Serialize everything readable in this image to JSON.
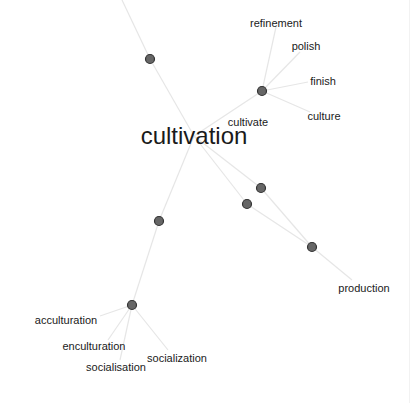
{
  "graph": {
    "type": "word-association-network",
    "center_word": "cultivation",
    "colors": {
      "background": "#ffffff",
      "node_fill": "#666666",
      "node_stroke": "#333333",
      "edge": "#e6e6e6",
      "label": "#1a1a1a"
    },
    "nodes": [
      {
        "id": "n_top",
        "x": 150,
        "y": 59
      },
      {
        "id": "n_cultivate",
        "x": 262,
        "y": 91
      },
      {
        "id": "n_mid1",
        "x": 261,
        "y": 188
      },
      {
        "id": "n_mid2",
        "x": 247,
        "y": 204
      },
      {
        "id": "n_left",
        "x": 159,
        "y": 221
      },
      {
        "id": "n_production",
        "x": 312,
        "y": 247
      },
      {
        "id": "n_social",
        "x": 132,
        "y": 305
      }
    ],
    "labels": [
      {
        "text": "cultivation",
        "x": 194,
        "y": 144,
        "size": "main"
      },
      {
        "text": "cultivate",
        "x": 248,
        "y": 126,
        "size": "small"
      },
      {
        "text": "refinement",
        "x": 276,
        "y": 27,
        "size": "small"
      },
      {
        "text": "polish",
        "x": 306,
        "y": 50,
        "size": "small"
      },
      {
        "text": "finish",
        "x": 323,
        "y": 85,
        "size": "small"
      },
      {
        "text": "culture",
        "x": 324,
        "y": 120,
        "size": "small"
      },
      {
        "text": "production",
        "x": 364,
        "y": 292,
        "size": "small"
      },
      {
        "text": "acculturation",
        "x": 66,
        "y": 324,
        "size": "small"
      },
      {
        "text": "enculturation",
        "x": 94,
        "y": 350,
        "size": "small"
      },
      {
        "text": "socialisation",
        "x": 116,
        "y": 371,
        "size": "small"
      },
      {
        "text": "socialization",
        "x": 177,
        "y": 362,
        "size": "small"
      }
    ],
    "edges": [
      {
        "from": [
          122,
          0
        ],
        "to": [
          150,
          59
        ]
      },
      {
        "from": [
          150,
          59
        ],
        "to": [
          194,
          136
        ]
      },
      {
        "from": [
          194,
          136
        ],
        "to": [
          262,
          91
        ]
      },
      {
        "from": [
          262,
          91
        ],
        "to": [
          276,
          27
        ]
      },
      {
        "from": [
          262,
          91
        ],
        "to": [
          300,
          52
        ]
      },
      {
        "from": [
          262,
          91
        ],
        "to": [
          308,
          82
        ]
      },
      {
        "from": [
          262,
          91
        ],
        "to": [
          310,
          112
        ]
      },
      {
        "from": [
          194,
          136
        ],
        "to": [
          261,
          188
        ]
      },
      {
        "from": [
          194,
          136
        ],
        "to": [
          247,
          204
        ]
      },
      {
        "from": [
          247,
          204
        ],
        "to": [
          312,
          247
        ]
      },
      {
        "from": [
          261,
          188
        ],
        "to": [
          312,
          247
        ]
      },
      {
        "from": [
          312,
          247
        ],
        "to": [
          352,
          280
        ]
      },
      {
        "from": [
          194,
          136
        ],
        "to": [
          159,
          221
        ]
      },
      {
        "from": [
          159,
          221
        ],
        "to": [
          132,
          305
        ]
      },
      {
        "from": [
          132,
          305
        ],
        "to": [
          100,
          316
        ]
      },
      {
        "from": [
          132,
          305
        ],
        "to": [
          108,
          340
        ]
      },
      {
        "from": [
          132,
          305
        ],
        "to": [
          120,
          360
        ]
      },
      {
        "from": [
          132,
          305
        ],
        "to": [
          168,
          350
        ]
      }
    ]
  }
}
